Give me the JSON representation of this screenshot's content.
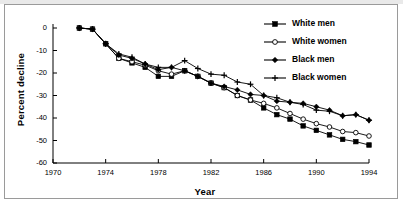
{
  "chart_data": {
    "type": "line",
    "title": "",
    "xlabel": "Year",
    "ylabel": "Percent decline",
    "xlim": [
      1970,
      1994
    ],
    "ylim": [
      -60,
      0
    ],
    "xticks": [
      1970,
      1974,
      1978,
      1982,
      1986,
      1990,
      1994
    ],
    "yticks": [
      0,
      -10,
      -20,
      -30,
      -40,
      -50,
      -60
    ],
    "xtick_labels": [
      "1970",
      "1974",
      "1978",
      "1982",
      "1986",
      "1990",
      "1994"
    ],
    "ytick_labels": [
      "0",
      "-10",
      "-20",
      "-30",
      "-40",
      "-50",
      "-60"
    ],
    "grid": false,
    "legend_position": "upper right",
    "x": [
      1972,
      1973,
      1974,
      1975,
      1976,
      1977,
      1978,
      1979,
      1980,
      1981,
      1982,
      1983,
      1984,
      1985,
      1986,
      1987,
      1988,
      1989,
      1990,
      1991,
      1992,
      1993,
      1994
    ],
    "series": [
      {
        "name": "White men",
        "marker": "filled-square",
        "values": [
          0,
          -0.5,
          -7,
          -13.5,
          -15.5,
          -17.5,
          -21.5,
          -21.5,
          -19,
          -21.5,
          -24.5,
          -26.5,
          -30,
          -32,
          -35.5,
          -38.5,
          -40.5,
          -43.5,
          -45.5,
          -47.5,
          -49.5,
          -50.5,
          -52
        ]
      },
      {
        "name": "White women",
        "marker": "open-circle",
        "values": [
          0,
          -0.5,
          -7,
          -13.5,
          -15,
          -16.5,
          -19,
          -20.5,
          -19,
          -21.5,
          -24.5,
          -26.5,
          -30,
          -32,
          -33.5,
          -35.5,
          -38,
          -40.5,
          -42.5,
          -44,
          -46,
          -46.5,
          -48
        ]
      },
      {
        "name": "Black men",
        "marker": "filled-diamond",
        "values": [
          0,
          -0.5,
          -7,
          -12,
          -13.5,
          -16,
          -18.5,
          -17.5,
          -19,
          -21.5,
          -24.5,
          -26,
          -27.5,
          -29.5,
          -30,
          -32.5,
          -33,
          -33.5,
          -35,
          -36.5,
          -39,
          -38.5,
          -41
        ]
      },
      {
        "name": "Black women",
        "marker": "plus",
        "values": [
          0,
          -0.5,
          -7,
          -11.5,
          -13,
          -16,
          -17.5,
          -17.5,
          -14.5,
          -18,
          -20.5,
          -21,
          -24,
          -25,
          -30,
          -31,
          -33,
          -34,
          -36.5,
          -37,
          -39,
          -38.5,
          -41
        ]
      }
    ]
  }
}
